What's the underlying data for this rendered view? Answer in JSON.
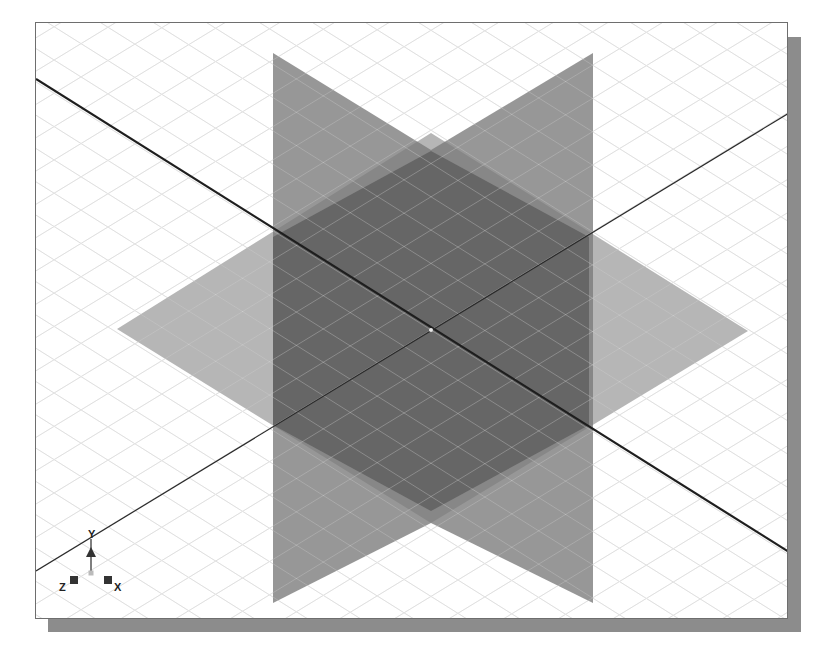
{
  "canvas": {
    "width": 817,
    "height": 660
  },
  "viewport": {
    "frame": {
      "x": 35,
      "y": 22,
      "width": 753,
      "height": 597
    },
    "shadow": {
      "x": 48,
      "y": 37,
      "width": 753,
      "height": 595
    },
    "colors": {
      "background": "#ffffff",
      "frame_border": "#6e6e6e",
      "shadow": "#8c8c8c",
      "grid": "#d6d6d6",
      "axis_thick": "#1e1e1e",
      "axis_thin": "#2a2a2a"
    }
  },
  "scene": {
    "origin": {
      "x": 430,
      "y": 329
    },
    "grid": {
      "spacing": 45,
      "slope_a": 0.628,
      "slope_b": -0.609
    },
    "axes": [
      {
        "name": "x-axis-line",
        "x1": 0,
        "y1": 56,
        "x2": 753,
        "y2": 529,
        "width": 2.2
      },
      {
        "name": "z-axis-line",
        "x1": 0,
        "y1": 548,
        "x2": 753,
        "y2": 90,
        "width": 1.2
      }
    ],
    "planes": [
      {
        "name": "xz-horizontal-plane",
        "fill": "#9a9a9a",
        "opacity": 0.72,
        "points": "81,306 395,110 712,308 395,500"
      },
      {
        "name": "xy-vertical-plane",
        "fill": "#7a7a7a",
        "opacity": 0.78,
        "points": "237,30 395,127 395,500 237,580"
      },
      {
        "name": "yz-vertical-plane",
        "fill": "#7a7a7a",
        "opacity": 0.78,
        "points": "557,30 395,127 395,500 557,580"
      },
      {
        "name": "center-overlap-hexagon",
        "fill": "#4a4a4a",
        "opacity": 0.55,
        "points": "395,128 553,214 553,402 395,488 237,402 237,214"
      }
    ],
    "origin_marker": {
      "x": 395,
      "y": 307,
      "r": 2,
      "fill": "#e8e8e8"
    }
  },
  "triad": {
    "origin": {
      "x": 55,
      "y": 550
    },
    "labels": {
      "y": "Y",
      "z": "Z",
      "x": "X"
    },
    "colors": {
      "body": "#333333",
      "stem": "#555555",
      "origin": "#bbbbbb"
    }
  }
}
